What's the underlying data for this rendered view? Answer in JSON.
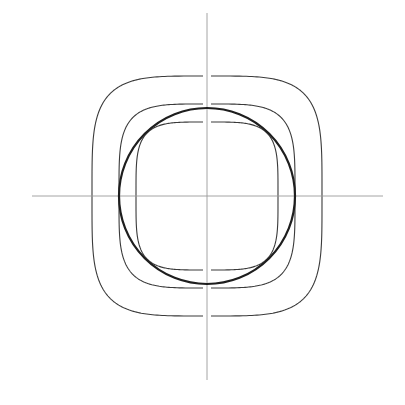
{
  "diagram": {
    "title": "",
    "background": "#ffffff",
    "center": {
      "x": 207,
      "y": 196
    },
    "axes": {
      "color": "#9a9a9a",
      "horizontal": {
        "x1": 32,
        "x2": 383,
        "y": 196
      },
      "vertical": {
        "x": 207,
        "y1": 13,
        "y2": 380
      }
    },
    "circle": {
      "cx": 207,
      "cy": 196,
      "r": 88,
      "stroke": "#1e1e1e",
      "stroke_width": 2.2
    },
    "squircles": [
      {
        "name": "outer",
        "cx": 207,
        "cy": 196,
        "rx": 115,
        "ry": 120,
        "n": 4.2,
        "stroke": "#3a3a3a",
        "stroke_width": 1.1
      },
      {
        "name": "middle",
        "cx": 207,
        "cy": 196,
        "rx": 88,
        "ry": 92,
        "n": 4.2,
        "stroke": "#3a3a3a",
        "stroke_width": 1.1
      },
      {
        "name": "inner",
        "cx": 207,
        "cy": 196,
        "rx": 71,
        "ry": 74,
        "n": 4.2,
        "stroke": "#3a3a3a",
        "stroke_width": 1.1
      }
    ],
    "axis_gap_px": 4
  }
}
